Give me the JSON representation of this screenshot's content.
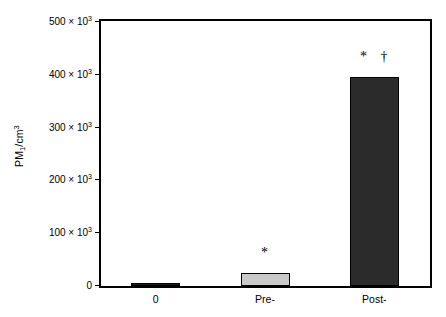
{
  "chart_data": {
    "type": "bar",
    "title": "",
    "xlabel": "",
    "ylabel": "PM1/cm3",
    "ylabel_parts": {
      "prefix": "PM",
      "sub": "1",
      "mid": "/cm",
      "sup": "3"
    },
    "categories": [
      "0",
      "Pre-",
      "Post-"
    ],
    "values": [
      2000,
      25000,
      395000
    ],
    "value_labels": [
      "2 × 10³",
      "25 × 10³",
      "395 × 10³"
    ],
    "bar_colors": [
      "#1a1a1a",
      "#c9c9c9",
      "#2b2b2b"
    ],
    "bar_edge_color": "#000000",
    "ylim": [
      0,
      500000
    ],
    "yticks": [
      0,
      100000,
      200000,
      300000,
      400000,
      500000
    ],
    "ytick_labels": [
      "0",
      "100 × 10³",
      "200 × 10³",
      "300 × 10³",
      "400 × 10³",
      "500 × 10³"
    ],
    "ytick_mantissas": [
      "0",
      "100 × 10",
      "200 × 10",
      "300 × 10",
      "400 × 10",
      "500 × 10"
    ],
    "ytick_exponents": [
      "",
      "3",
      "3",
      "3",
      "3",
      "3"
    ],
    "grid": false,
    "legend": null,
    "annotations": [
      {
        "category": "0",
        "text": ""
      },
      {
        "category": "Pre-",
        "text": "*"
      },
      {
        "category": "Post-",
        "text": "* †"
      }
    ],
    "footnote_symbols": {
      "asterisk": "*",
      "dagger": "†"
    }
  }
}
